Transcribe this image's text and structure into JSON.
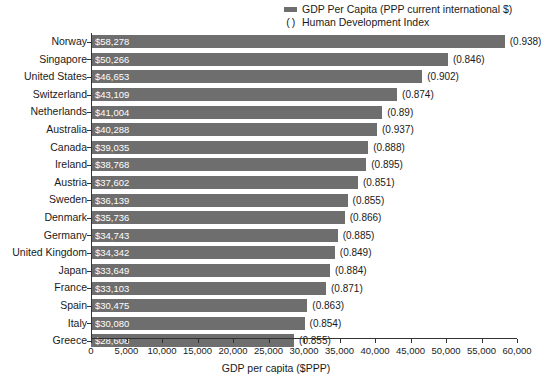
{
  "chart_data": {
    "type": "bar",
    "orientation": "horizontal",
    "title": "",
    "subtitle": "",
    "xlabel": "GDP per capita ($PPP)",
    "ylabel": "",
    "xlim": [
      0,
      60000
    ],
    "xtick_step": 5000,
    "grid": false,
    "legend_position": "top-right",
    "bar_color": "#6e6e6e",
    "value_label_color": "#ffffff",
    "categories": [
      "Norway",
      "Singapore",
      "United States",
      "Switzerland",
      "Netherlands",
      "Australia",
      "Canada",
      "Ireland",
      "Austria",
      "Sweden",
      "Denmark",
      "Germany",
      "United Kingdom",
      "Japan",
      "France",
      "Spain",
      "Italy",
      "Greece"
    ],
    "series": [
      {
        "name": "GDP Per Capita (PPP current international $)",
        "values": [
          58278,
          50266,
          46653,
          43109,
          41004,
          40288,
          39035,
          38768,
          37602,
          36139,
          35736,
          34743,
          34342,
          33649,
          33103,
          30475,
          30080,
          28608
        ]
      },
      {
        "name": "Human Development Index",
        "values": [
          0.938,
          0.846,
          0.902,
          0.874,
          0.89,
          0.937,
          0.888,
          0.895,
          0.851,
          0.855,
          0.866,
          0.885,
          0.849,
          0.884,
          0.871,
          0.863,
          0.854,
          0.855
        ]
      }
    ],
    "value_labels": [
      "$58,278",
      "$50,266",
      "$46,653",
      "$43,109",
      "$41,004",
      "$40,288",
      "$39,035",
      "$38,768",
      "$37,602",
      "$36,139",
      "$35,736",
      "$34,743",
      "$34,342",
      "$33,649",
      "$33,103",
      "$30,475",
      "$30,080",
      "$28,608"
    ],
    "hdi_labels": [
      "(0.938)",
      "(0.846)",
      "(0.902)",
      "(0.874)",
      "(0.89)",
      "(0.937)",
      "(0.888)",
      "(0.895)",
      "(0.851)",
      "(0.855)",
      "(0.866)",
      "(0.885)",
      "(0.849)",
      "(0.884)",
      "(0.871)",
      "(0.863)",
      "(0.854)",
      "(0.855)"
    ],
    "xtick_labels": [
      "0",
      "5,000",
      "10,000",
      "15,000",
      "20,000",
      "25,000",
      "30,000",
      "35,000",
      "40,000",
      "45,000",
      "50,000",
      "55,000",
      "60,000"
    ]
  },
  "legend": {
    "entries": [
      {
        "marker": "swatch",
        "label": "GDP Per Capita (PPP current international $)"
      },
      {
        "marker": "( )",
        "label": "Human Development Index"
      }
    ]
  }
}
